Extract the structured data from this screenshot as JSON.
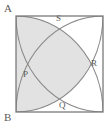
{
  "figure": {
    "kind": "geometry-diagram",
    "canvas": {
      "width": 112,
      "height": 129
    },
    "square": {
      "name": "square-ABCD",
      "left": 16,
      "top": 16,
      "right": 103,
      "bottom": 112,
      "stroke": "#7a7a7a",
      "stroke_width": 1.2,
      "fill": "#ffffff"
    },
    "arcs": [
      {
        "name": "arc-from-top-left-corner",
        "center": "A",
        "cx": 16,
        "cy": 16,
        "rx": 87,
        "ry": 96
      },
      {
        "name": "arc-from-top-right-corner",
        "center": "D",
        "cx": 103,
        "cy": 16,
        "rx": 87,
        "ry": 96
      },
      {
        "name": "arc-from-bottom-left-corner",
        "center": "B",
        "cx": 16,
        "cy": 112,
        "rx": 87,
        "ry": 96
      },
      {
        "name": "arc-from-bottom-right-corner",
        "center": "C",
        "cx": 103,
        "cy": 112,
        "rx": 87,
        "ry": 96
      }
    ],
    "shaded_region": {
      "name": "shaded-petal-upper-left",
      "fill": "#e2e2e2",
      "opacity": 1
    },
    "vertex_labels": [
      {
        "id": "A",
        "text": "A",
        "x": 4,
        "y": 3,
        "position": "outside-top-left"
      },
      {
        "id": "B",
        "text": "B",
        "x": 4,
        "y": 112,
        "position": "outside-bottom-left"
      }
    ],
    "point_labels": [
      {
        "id": "P",
        "text": "P",
        "x": 23,
        "y": 70,
        "position": "left"
      },
      {
        "id": "Q",
        "text": "Q",
        "x": 59,
        "y": 101,
        "position": "bottom"
      },
      {
        "id": "R",
        "text": "R",
        "x": 91,
        "y": 59,
        "position": "right"
      },
      {
        "id": "S",
        "text": "S",
        "x": 56,
        "y": 14,
        "position": "top"
      }
    ],
    "colors": {
      "stroke": "#7a7a7a",
      "arc_stroke": "#8a8a8a",
      "shade": "#e2e2e2",
      "label": "#5a5a5a",
      "background": "#ffffff"
    }
  }
}
